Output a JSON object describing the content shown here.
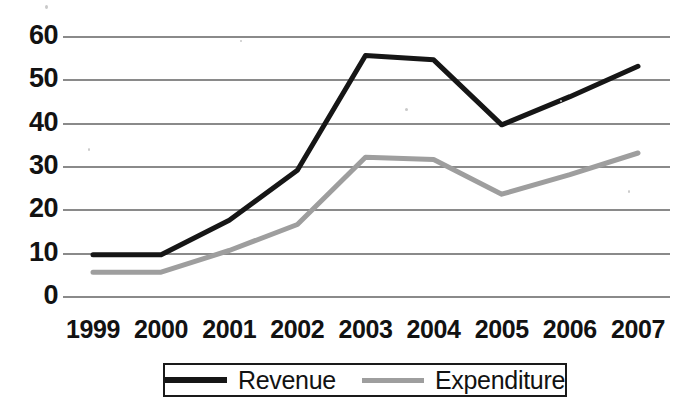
{
  "chart_data": {
    "type": "line",
    "title": "",
    "xlabel": "",
    "ylabel": "",
    "categories": [
      "1999",
      "2000",
      "2001",
      "2002",
      "2003",
      "2004",
      "2005",
      "2006",
      "2007"
    ],
    "series": [
      {
        "name": "Revenue",
        "color": "#161616",
        "values": [
          9.5,
          9.5,
          17.5,
          29,
          55.5,
          54.5,
          39.5,
          46,
          53
        ]
      },
      {
        "name": "Expenditure",
        "color": "#9e9e9e",
        "values": [
          5.5,
          5.5,
          10.5,
          16.5,
          32,
          31.5,
          23.5,
          28,
          33
        ]
      }
    ],
    "ylim": [
      0,
      60
    ],
    "ytick_labels": [
      "60",
      "50",
      "40",
      "30",
      "20",
      "10",
      "0"
    ],
    "ytick_values": [
      60,
      50,
      40,
      30,
      20,
      10,
      0
    ],
    "grid": "horizontal",
    "legend_position": "bottom"
  },
  "legend": {
    "items": [
      {
        "label": "Revenue",
        "swatch": "revenue-line-swatch"
      },
      {
        "label": "Expenditure",
        "swatch": "expenditure-line-swatch"
      }
    ]
  },
  "colors": {
    "revenue": "#161616",
    "expenditure": "#9e9e9e",
    "gridline": "#8a8a8a",
    "text": "#121212",
    "background": "#ffffff"
  }
}
